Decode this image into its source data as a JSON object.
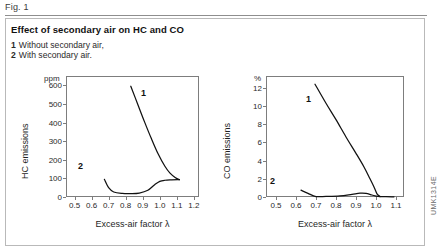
{
  "figure": {
    "label": "Fig. 1",
    "title": "Effect of secondary air on HC and CO",
    "side_code": "UMK1314E",
    "legend": [
      {
        "num": "1",
        "text": "Without secondary air,"
      },
      {
        "num": "2",
        "text": "With secondary air."
      }
    ]
  },
  "chart_data": [
    {
      "type": "line",
      "id": "hc",
      "title": "",
      "unit_label": "ppm",
      "ylabel": "HC emissions",
      "xlabel": "Excess-air factor λ",
      "xlim": [
        0.45,
        1.23
      ],
      "ylim": [
        0,
        650
      ],
      "xticks": [
        0.5,
        0.6,
        0.7,
        0.8,
        0.9,
        1.0,
        1.1,
        1.2
      ],
      "xticklabels": [
        "0.5",
        "0.6",
        "0.7",
        "0.8",
        "0.9",
        "1.0",
        "1.1",
        "1.2"
      ],
      "yticks": [
        0,
        100,
        200,
        300,
        400,
        500,
        600
      ],
      "yticklabels": [
        "0",
        "100",
        "200",
        "300",
        "400",
        "500",
        "600"
      ],
      "grid": false,
      "legend_position": "inline-annotation",
      "series": [
        {
          "name": "1",
          "label": "1",
          "annotation": "1",
          "x": [
            0.83,
            0.87,
            0.91,
            0.95,
            0.99,
            1.03,
            1.06,
            1.09,
            1.115
          ],
          "y": [
            595,
            500,
            405,
            315,
            232,
            165,
            128,
            105,
            93
          ]
        },
        {
          "name": "2",
          "label": "2",
          "annotation": "2",
          "x": [
            0.675,
            0.7,
            0.73,
            0.78,
            0.83,
            0.88,
            0.93,
            0.97,
            1.0,
            1.03,
            1.07,
            1.115
          ],
          "y": [
            95,
            50,
            27,
            19,
            18,
            21,
            36,
            66,
            84,
            90,
            92,
            93
          ]
        }
      ]
    },
    {
      "type": "line",
      "id": "co",
      "title": "",
      "unit_label": "%",
      "ylabel": "CO emissions",
      "xlabel": "Excess-air factor λ",
      "xlim": [
        0.45,
        1.14
      ],
      "ylim": [
        0,
        13.3
      ],
      "xticks": [
        0.5,
        0.6,
        0.7,
        0.8,
        0.9,
        1.0,
        1.1
      ],
      "xticklabels": [
        "0.5",
        "0.6",
        "0.7",
        "0.8",
        "0.9",
        "1.0",
        "1.1"
      ],
      "yticks": [
        0,
        2,
        4,
        6,
        8,
        10,
        12
      ],
      "yticklabels": [
        "0",
        "2",
        "4",
        "6",
        "8",
        "10",
        "12"
      ],
      "grid": false,
      "legend_position": "inline-annotation",
      "series": [
        {
          "name": "1",
          "label": "1",
          "annotation": "1",
          "x": [
            0.695,
            0.75,
            0.8,
            0.85,
            0.9,
            0.94,
            0.97,
            0.99,
            1.005,
            1.02
          ],
          "y": [
            12.4,
            10.3,
            8.5,
            6.6,
            4.8,
            3.3,
            2.0,
            1.1,
            0.35,
            0.05
          ]
        },
        {
          "name": "2",
          "label": "2",
          "annotation": "2",
          "x": [
            0.625,
            0.66,
            0.7,
            0.75,
            0.82,
            0.88,
            0.92,
            0.95,
            0.98,
            1.01,
            1.05,
            1.09
          ],
          "y": [
            0.75,
            0.4,
            0.05,
            0.06,
            0.12,
            0.3,
            0.42,
            0.4,
            0.22,
            0.06,
            0.03,
            0.02
          ]
        }
      ]
    }
  ]
}
